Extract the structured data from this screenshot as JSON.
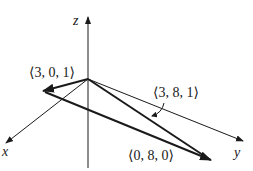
{
  "diagram": {
    "axes": {
      "x_label": "x",
      "y_label": "y",
      "z_label": "z"
    },
    "vectors": [
      {
        "name": "vector-3-0-1",
        "label": "⟨3, 0, 1⟩",
        "components": [
          3,
          0,
          1
        ]
      },
      {
        "name": "vector-3-8-1",
        "label": "⟨3, 8, 1⟩",
        "components": [
          3,
          8,
          1
        ]
      },
      {
        "name": "vector-0-8-0",
        "label": "⟨0, 8, 0⟩",
        "components": [
          0,
          8,
          0
        ]
      }
    ],
    "colors": {
      "line": "#1a1a1a",
      "background": "#ffffff"
    }
  }
}
